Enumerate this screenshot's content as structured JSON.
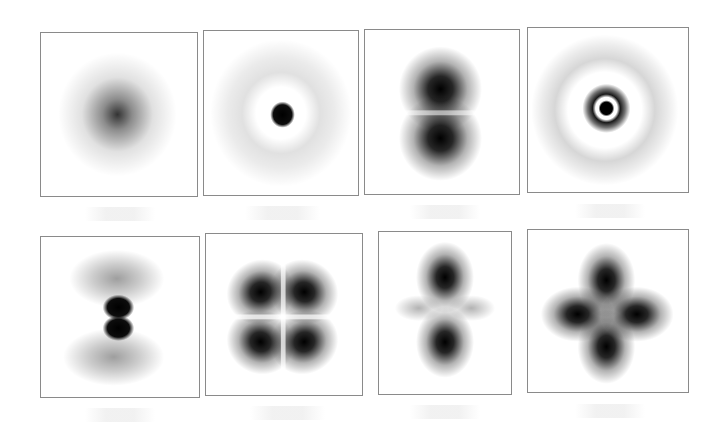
{
  "figure": {
    "colors": {
      "border": "#8a8a8a",
      "background": "#ffffff",
      "density": "#000000"
    },
    "panels": [
      {
        "index": 1,
        "row": 1,
        "col": 1,
        "pattern": "single diffuse central blob"
      },
      {
        "index": 2,
        "row": 1,
        "col": 2,
        "pattern": "dark central dot with faint outer ring"
      },
      {
        "index": 3,
        "row": 1,
        "col": 3,
        "pattern": "two vertical lobes (dumbbell)"
      },
      {
        "index": 4,
        "row": 1,
        "col": 4,
        "pattern": "central dot, dark inner ring, faint outer ring"
      },
      {
        "index": 5,
        "row": 2,
        "col": 1,
        "pattern": "two small central lobes with faint outer arcs above and below"
      },
      {
        "index": 6,
        "row": 2,
        "col": 2,
        "pattern": "four diagonal lobes (cloverleaf)"
      },
      {
        "index": 7,
        "row": 2,
        "col": 3,
        "pattern": "two vertical lobes with faint horizontal torus"
      },
      {
        "index": 8,
        "row": 2,
        "col": 4,
        "pattern": "four axial lobes (cloverleaf)"
      }
    ],
    "labels_legible": false
  }
}
